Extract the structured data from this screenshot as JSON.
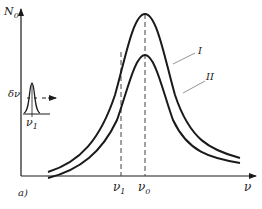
{
  "figure": {
    "panel_label": "a)",
    "y_axis_label": "N",
    "y_axis_subscript": "0",
    "x_axis_label": "ν",
    "x_ticks": [
      {
        "label": "ν",
        "subscript": "1"
      },
      {
        "label": "ν",
        "subscript": "0"
      }
    ],
    "curves": [
      {
        "label": "I",
        "description": "upper resonance curve"
      },
      {
        "label": "II",
        "description": "lower resonance curve"
      }
    ],
    "inset": {
      "width_label": "δν",
      "center_label": "ν",
      "center_subscript": "1"
    },
    "colors": {
      "line": "#1a1a1a",
      "dashed": "#444444",
      "background": "#ffffff"
    }
  }
}
